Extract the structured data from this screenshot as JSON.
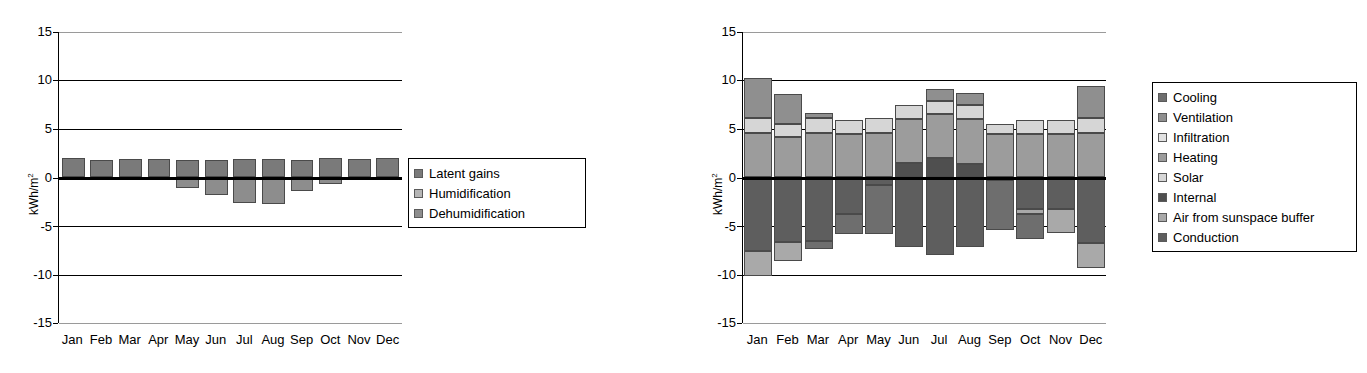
{
  "figure": {
    "width": 1367,
    "height": 373,
    "background": "#ffffff"
  },
  "charts": [
    {
      "id": "latent-loads-chart",
      "name": "latent-loads-monthly-chart",
      "ylabel": "kWh/m",
      "ylabel_sup": "2",
      "yticks": [
        "15",
        "10",
        "5",
        "0",
        "-5",
        "-10",
        "-15"
      ],
      "ytick_values": [
        15,
        10,
        5,
        0,
        -5,
        -10,
        -15
      ],
      "ylim": [
        -15,
        15
      ],
      "categories": [
        "Jan",
        "Feb",
        "Mar",
        "Apr",
        "May",
        "Jun",
        "Jul",
        "Aug",
        "Sep",
        "Oct",
        "Nov",
        "Dec"
      ],
      "legend": [
        {
          "label": "Latent gains",
          "color": "#7a7a7a"
        },
        {
          "label": "Humidification",
          "color": "#b5b5b5"
        },
        {
          "label": "Dehumidification",
          "color": "#8d8d8d"
        }
      ],
      "legend_position": "right"
    },
    {
      "id": "energy-balance-chart",
      "name": "energy-balance-monthly-chart",
      "ylabel": "kWh/m",
      "ylabel_sup": "2",
      "yticks": [
        "15",
        "10",
        "5",
        "0",
        "-5",
        "-10",
        "-15"
      ],
      "ytick_values": [
        15,
        10,
        5,
        0,
        -5,
        -10,
        -15
      ],
      "ylim": [
        -15,
        15
      ],
      "categories": [
        "Jan",
        "Feb",
        "Mar",
        "Apr",
        "May",
        "Jun",
        "Jul",
        "Aug",
        "Sep",
        "Oct",
        "Nov",
        "Dec"
      ],
      "legend": [
        {
          "label": "Cooling",
          "color": "#6e6e6e"
        },
        {
          "label": "Ventilation",
          "color": "#8f8f8f"
        },
        {
          "label": "Infiltration",
          "color": "#e2e2e2"
        },
        {
          "label": "Heating",
          "color": "#9c9c9c"
        },
        {
          "label": "Solar",
          "color": "#d6d6d6"
        },
        {
          "label": "Internal",
          "color": "#4f4f4f"
        },
        {
          "label": "Air from sunspace buffer",
          "color": "#a9a9a9"
        },
        {
          "label": "Conduction",
          "color": "#5e5e5e"
        }
      ],
      "legend_position": "right"
    }
  ],
  "chart_data": [
    {
      "type": "bar",
      "subtype": "stacked-diverging",
      "title": "",
      "xlabel": "",
      "ylabel": "kWh/m2",
      "ylim": [
        -15,
        15
      ],
      "yticks": [
        -15,
        -10,
        -5,
        0,
        5,
        10,
        15
      ],
      "grid": true,
      "legend": "right",
      "categories": [
        "Jan",
        "Feb",
        "Mar",
        "Apr",
        "May",
        "Jun",
        "Jul",
        "Aug",
        "Sep",
        "Oct",
        "Nov",
        "Dec"
      ],
      "series": [
        {
          "name": "Latent gains",
          "color": "#7a7a7a",
          "values": [
            2.0,
            1.8,
            1.9,
            1.9,
            1.8,
            1.8,
            1.9,
            1.9,
            1.8,
            2.0,
            1.9,
            2.0
          ]
        },
        {
          "name": "Humidification",
          "color": "#b5b5b5",
          "values": [
            0.0,
            0.0,
            0.0,
            0.0,
            0.0,
            0.0,
            0.0,
            0.0,
            0.0,
            0.0,
            0.0,
            0.0
          ]
        },
        {
          "name": "Dehumidification",
          "color": "#8d8d8d",
          "values": [
            -0.1,
            -0.3,
            -0.3,
            -0.1,
            -1.1,
            -1.8,
            -2.6,
            -2.7,
            -1.4,
            -0.7,
            -0.3,
            -0.2
          ]
        }
      ]
    },
    {
      "type": "bar",
      "subtype": "stacked-diverging",
      "title": "",
      "xlabel": "",
      "ylabel": "kWh/m2",
      "ylim": [
        -15,
        15
      ],
      "yticks": [
        -15,
        -10,
        -5,
        0,
        5,
        10,
        15
      ],
      "grid": true,
      "legend": "right",
      "categories": [
        "Jan",
        "Feb",
        "Mar",
        "Apr",
        "May",
        "Jun",
        "Jul",
        "Aug",
        "Sep",
        "Oct",
        "Nov",
        "Dec"
      ],
      "series": [
        {
          "name": "Internal",
          "color": "#4f4f4f",
          "values": [
            0.0,
            0.0,
            0.0,
            0.0,
            0.0,
            1.5,
            2.0,
            1.4,
            0.0,
            0.0,
            0.0,
            0.0
          ]
        },
        {
          "name": "Heating",
          "color": "#9c9c9c",
          "values": [
            4.6,
            4.2,
            4.6,
            4.5,
            4.6,
            4.5,
            4.5,
            4.6,
            4.5,
            4.5,
            4.5,
            4.6
          ]
        },
        {
          "name": "Solar",
          "color": "#d6d6d6",
          "values": [
            1.5,
            1.3,
            1.5,
            1.4,
            1.5,
            1.5,
            1.4,
            1.5,
            1.0,
            1.4,
            1.4,
            1.5
          ]
        },
        {
          "name": "Ventilation",
          "color": "#8f8f8f",
          "values": [
            4.2,
            3.1,
            0.5,
            0.0,
            0.0,
            0.0,
            1.2,
            1.2,
            0.0,
            0.0,
            0.0,
            3.3
          ]
        },
        {
          "name": "Conduction",
          "color": "#5e5e5e",
          "values": [
            -7.6,
            -6.7,
            -6.5,
            -3.8,
            -0.8,
            -7.2,
            -8.0,
            -7.2,
            -0.3,
            -3.2,
            -3.2,
            -6.8
          ]
        },
        {
          "name": "Air from sunspace buffer",
          "color": "#a9a9a9",
          "values": [
            -2.6,
            -1.9,
            0.0,
            0.0,
            0.0,
            0.0,
            0.0,
            0.0,
            0.0,
            -0.6,
            -2.5,
            -2.5
          ]
        },
        {
          "name": "Cooling",
          "color": "#6e6e6e",
          "values": [
            0.0,
            0.0,
            -0.9,
            -2.0,
            -5.0,
            0.0,
            0.0,
            0.0,
            -5.1,
            -2.5,
            0.0,
            0.0
          ]
        },
        {
          "name": "Infiltration",
          "color": "#e2e2e2",
          "values": [
            0.0,
            0.0,
            0.0,
            0.0,
            0.0,
            0.0,
            0.0,
            0.0,
            0.0,
            0.0,
            0.0,
            0.0
          ]
        }
      ],
      "bar_positive_totals": [
        10.3,
        8.6,
        6.6,
        5.9,
        6.1,
        7.5,
        8.1,
        7.3,
        5.5,
        5.9,
        5.9,
        9.4
      ],
      "bar_negative_totals": [
        -10.2,
        -8.6,
        -6.5,
        -5.8,
        -5.8,
        -7.2,
        -8.0,
        -7.2,
        -5.4,
        -5.8,
        -5.7,
        -9.3
      ]
    }
  ]
}
